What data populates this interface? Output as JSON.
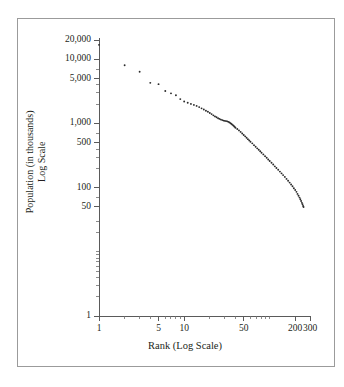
{
  "chart_data": {
    "type": "scatter",
    "title": "",
    "xlabel": "Rank (Log Scale)",
    "ylabel": "Population (in thousands)\nLog Scale",
    "ylabel_line1": "Population (in thousands)",
    "ylabel_line2": "Log Scale",
    "xscale": "log",
    "yscale": "log",
    "xlim": [
      1,
      300
    ],
    "ylim": [
      1,
      20000
    ],
    "grid": false,
    "legend": null,
    "marker_color": "#2b2b2b",
    "axis_color": "#5a5a5a",
    "frame_color": "#9b9b9b",
    "background": "#ffffff",
    "xticks": [
      {
        "value": 1,
        "label": "1",
        "type": "major"
      },
      {
        "value": 2,
        "label": "",
        "type": "minor"
      },
      {
        "value": 3,
        "label": "",
        "type": "minor"
      },
      {
        "value": 4,
        "label": "",
        "type": "minor"
      },
      {
        "value": 5,
        "label": "5",
        "type": "major"
      },
      {
        "value": 6,
        "label": "",
        "type": "minor"
      },
      {
        "value": 7,
        "label": "",
        "type": "minor"
      },
      {
        "value": 8,
        "label": "",
        "type": "minor"
      },
      {
        "value": 9,
        "label": "",
        "type": "minor"
      },
      {
        "value": 10,
        "label": "10",
        "type": "major"
      },
      {
        "value": 20,
        "label": "",
        "type": "minor"
      },
      {
        "value": 30,
        "label": "",
        "type": "minor"
      },
      {
        "value": 40,
        "label": "",
        "type": "minor"
      },
      {
        "value": 50,
        "label": "50",
        "type": "major"
      },
      {
        "value": 60,
        "label": "",
        "type": "minor"
      },
      {
        "value": 70,
        "label": "",
        "type": "minor"
      },
      {
        "value": 80,
        "label": "",
        "type": "minor"
      },
      {
        "value": 90,
        "label": "",
        "type": "minor"
      },
      {
        "value": 100,
        "label": "",
        "type": "minor"
      },
      {
        "value": 200,
        "label": "200",
        "type": "major"
      },
      {
        "value": 300,
        "label": "300",
        "type": "major"
      }
    ],
    "yticks": [
      {
        "value": 1,
        "label": "1",
        "type": "major"
      },
      {
        "value": 2,
        "label": "",
        "type": "minor"
      },
      {
        "value": 3,
        "label": "",
        "type": "minor"
      },
      {
        "value": 4,
        "label": "",
        "type": "minor"
      },
      {
        "value": 5,
        "label": "",
        "type": "minor"
      },
      {
        "value": 6,
        "label": "",
        "type": "minor"
      },
      {
        "value": 7,
        "label": "",
        "type": "minor"
      },
      {
        "value": 8,
        "label": "",
        "type": "minor"
      },
      {
        "value": 9,
        "label": "",
        "type": "minor"
      },
      {
        "value": 10,
        "label": "",
        "type": "minor"
      },
      {
        "value": 20,
        "label": "",
        "type": "minor"
      },
      {
        "value": 30,
        "label": "",
        "type": "minor"
      },
      {
        "value": 50,
        "label": "50",
        "type": "major"
      },
      {
        "value": 70,
        "label": "",
        "type": "minor"
      },
      {
        "value": 100,
        "label": "100",
        "type": "major"
      },
      {
        "value": 200,
        "label": "",
        "type": "minor"
      },
      {
        "value": 300,
        "label": "",
        "type": "minor"
      },
      {
        "value": 400,
        "label": "",
        "type": "minor"
      },
      {
        "value": 500,
        "label": "500",
        "type": "major"
      },
      {
        "value": 700,
        "label": "",
        "type": "minor"
      },
      {
        "value": 1000,
        "label": "1,000",
        "type": "major"
      },
      {
        "value": 2000,
        "label": "",
        "type": "minor"
      },
      {
        "value": 3000,
        "label": "",
        "type": "minor"
      },
      {
        "value": 4000,
        "label": "",
        "type": "minor"
      },
      {
        "value": 5000,
        "label": "5,000",
        "type": "major"
      },
      {
        "value": 7000,
        "label": "",
        "type": "minor"
      },
      {
        "value": 10000,
        "label": "10,000",
        "type": "major"
      },
      {
        "value": 20000,
        "label": "20,000",
        "type": "major"
      }
    ],
    "points": [
      {
        "x": 1,
        "y": 16800
      },
      {
        "x": 2,
        "y": 8100
      },
      {
        "x": 3,
        "y": 6400
      },
      {
        "x": 4,
        "y": 4300
      },
      {
        "x": 5,
        "y": 4100
      },
      {
        "x": 6,
        "y": 3200
      },
      {
        "x": 7,
        "y": 2950
      },
      {
        "x": 8,
        "y": 2750
      },
      {
        "x": 9,
        "y": 2400
      },
      {
        "x": 10,
        "y": 2200
      },
      {
        "x": 11,
        "y": 2100
      },
      {
        "x": 12,
        "y": 2020
      },
      {
        "x": 13,
        "y": 1950
      },
      {
        "x": 14,
        "y": 1880
      },
      {
        "x": 15,
        "y": 1800
      },
      {
        "x": 16,
        "y": 1720
      },
      {
        "x": 17,
        "y": 1650
      },
      {
        "x": 18,
        "y": 1580
      },
      {
        "x": 19,
        "y": 1520
      },
      {
        "x": 20,
        "y": 1460
      },
      {
        "x": 21,
        "y": 1400
      },
      {
        "x": 22,
        "y": 1340
      },
      {
        "x": 23,
        "y": 1290
      },
      {
        "x": 24,
        "y": 1250
      },
      {
        "x": 25,
        "y": 1210
      },
      {
        "x": 26,
        "y": 1180
      },
      {
        "x": 27,
        "y": 1150
      },
      {
        "x": 28,
        "y": 1130
      },
      {
        "x": 29,
        "y": 1110
      },
      {
        "x": 30,
        "y": 1100
      },
      {
        "x": 31,
        "y": 1090
      },
      {
        "x": 32,
        "y": 1080
      },
      {
        "x": 33,
        "y": 1060
      },
      {
        "x": 34,
        "y": 1040
      },
      {
        "x": 35,
        "y": 1010
      },
      {
        "x": 36,
        "y": 980
      },
      {
        "x": 37,
        "y": 950
      },
      {
        "x": 38,
        "y": 920
      },
      {
        "x": 39,
        "y": 890
      },
      {
        "x": 40,
        "y": 860
      },
      {
        "x": 42,
        "y": 820
      },
      {
        "x": 44,
        "y": 780
      },
      {
        "x": 46,
        "y": 740
      },
      {
        "x": 48,
        "y": 700
      },
      {
        "x": 50,
        "y": 660
      },
      {
        "x": 52,
        "y": 630
      },
      {
        "x": 54,
        "y": 600
      },
      {
        "x": 56,
        "y": 570
      },
      {
        "x": 58,
        "y": 545
      },
      {
        "x": 60,
        "y": 520
      },
      {
        "x": 63,
        "y": 490
      },
      {
        "x": 66,
        "y": 460
      },
      {
        "x": 69,
        "y": 435
      },
      {
        "x": 72,
        "y": 410
      },
      {
        "x": 75,
        "y": 390
      },
      {
        "x": 78,
        "y": 370
      },
      {
        "x": 81,
        "y": 350
      },
      {
        "x": 85,
        "y": 330
      },
      {
        "x": 89,
        "y": 310
      },
      {
        "x": 93,
        "y": 292
      },
      {
        "x": 97,
        "y": 275
      },
      {
        "x": 101,
        "y": 260
      },
      {
        "x": 106,
        "y": 245
      },
      {
        "x": 111,
        "y": 230
      },
      {
        "x": 116,
        "y": 215
      },
      {
        "x": 121,
        "y": 203
      },
      {
        "x": 127,
        "y": 190
      },
      {
        "x": 133,
        "y": 178
      },
      {
        "x": 139,
        "y": 167
      },
      {
        "x": 145,
        "y": 157
      },
      {
        "x": 152,
        "y": 147
      },
      {
        "x": 159,
        "y": 137
      },
      {
        "x": 166,
        "y": 128
      },
      {
        "x": 173,
        "y": 120
      },
      {
        "x": 180,
        "y": 112
      },
      {
        "x": 187,
        "y": 105
      },
      {
        "x": 194,
        "y": 98
      },
      {
        "x": 201,
        "y": 92
      },
      {
        "x": 208,
        "y": 86
      },
      {
        "x": 214,
        "y": 80
      },
      {
        "x": 220,
        "y": 75
      },
      {
        "x": 226,
        "y": 70
      },
      {
        "x": 231,
        "y": 66
      },
      {
        "x": 236,
        "y": 62
      },
      {
        "x": 241,
        "y": 58
      },
      {
        "x": 245,
        "y": 55
      },
      {
        "x": 249,
        "y": 52
      },
      {
        "x": 252,
        "y": 50
      }
    ]
  },
  "geometry": {
    "plot_left": 99,
    "plot_right": 310,
    "plot_top": 40,
    "plot_bottom": 316
  }
}
